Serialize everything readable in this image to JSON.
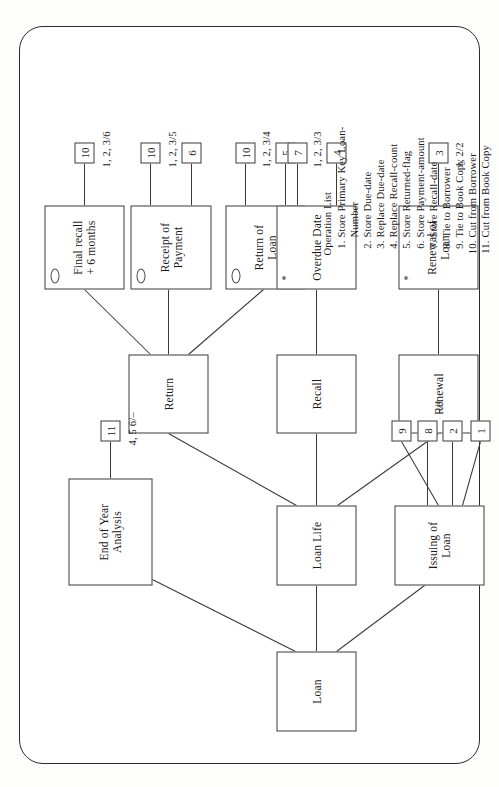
{
  "diagram": {
    "root": {
      "id": "loan",
      "label": "Loan"
    },
    "level2": [
      {
        "id": "end-of-year-analysis",
        "label": "End of Year\nAnalysis"
      },
      {
        "id": "loan-life",
        "label": "Loan Life"
      },
      {
        "id": "issuing-of-loan",
        "label": "Issuing of\nLoan"
      }
    ],
    "level3": [
      {
        "id": "return",
        "label": "Return"
      },
      {
        "id": "recall",
        "label": "Recall"
      },
      {
        "id": "renewal",
        "label": "Renewal"
      }
    ],
    "level4": [
      {
        "id": "final-recall-6-months",
        "label": "Final recall\n+ 6 months",
        "marker": "circle",
        "ops": [
          "10"
        ],
        "tag": "1, 2, 3/6"
      },
      {
        "id": "receipt-of-payment",
        "label": "Receipt of\nPayment",
        "marker": "circle",
        "ops": [
          "10",
          "6"
        ],
        "tag": "1, 2, 3/5"
      },
      {
        "id": "return-of-loan",
        "label": "Return of\nLoan",
        "marker": "circle",
        "ops": [
          "10",
          "5"
        ],
        "tag": "1, 2, 3/4"
      },
      {
        "id": "overdue-date",
        "label": "Overdue Date",
        "marker": "asterisk",
        "ops": [
          "7",
          "4"
        ],
        "tag": "1, 2, 3/3"
      },
      {
        "id": "renewal-of-loan",
        "label": "Renewal of\nLoan",
        "marker": "asterisk",
        "ops": [
          "3"
        ],
        "tag": "1, 2/2"
      }
    ],
    "end_of_year_ops": [
      "11"
    ],
    "end_of_year_tag": "4, 5 6/–",
    "issuing_ops": [
      "9",
      "8",
      "2",
      "1"
    ],
    "issuing_tag": "–/1"
  },
  "legend": {
    "heading": "Operation  List",
    "items": [
      {
        "n": "1.",
        "text": "Store Primary Key Loan-",
        "cont": "Number"
      },
      {
        "n": "2.",
        "text": "Store Due-date",
        "cont": ""
      },
      {
        "n": "3.",
        "text": "Replace Due-date",
        "cont": ""
      },
      {
        "n": "4.",
        "text": "Replace Recall-count",
        "cont": ""
      },
      {
        "n": "5.",
        "text": "Store Returned-flag",
        "cont": ""
      },
      {
        "n": "6.",
        "text": "Store Payment-amount",
        "cont": ""
      },
      {
        "n": "7.",
        "text": "Store Recall-date",
        "cont": ""
      },
      {
        "n": "8.",
        "text": "Tie to Borrower",
        "cont": ""
      },
      {
        "n": "9.",
        "text": "Tie to Book Copy",
        "cont": ""
      },
      {
        "n": "10.",
        "text": "Cut from Borrower",
        "cont": ""
      },
      {
        "n": "11.",
        "text": "Cut from Book Copy",
        "cont": ""
      }
    ]
  },
  "colors": {
    "ink": "#3a3a3a",
    "paper": "#ffffff",
    "frame": "#2b2b2b"
  }
}
